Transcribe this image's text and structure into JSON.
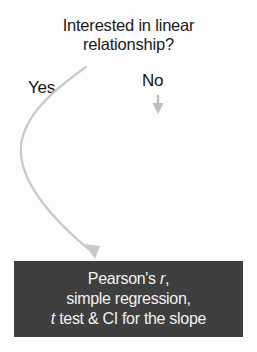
{
  "diagram": {
    "type": "decision-flowchart",
    "background_color": "#fdfdfd",
    "question": {
      "line1": "Interested in linear",
      "line2": "relationship?",
      "text_color": "#1a1a1a"
    },
    "branches": [
      {
        "label": "Yes",
        "arrow": "curved-arrow-down-left",
        "arrow_color": "#c9c9c9"
      },
      {
        "label": "No",
        "arrow": "straight-arrow-down",
        "arrow_color": "#bdbdbd"
      }
    ],
    "result_box": {
      "fill_color": "#3f3f3f",
      "text_color": "#f2f2f2",
      "line1_prefix": "Pearson's ",
      "line1_italic": "r",
      "line1_suffix": ",",
      "line2": "simple regression,",
      "line3_italic": "t",
      "line3_suffix": " test & CI for the slope"
    }
  }
}
